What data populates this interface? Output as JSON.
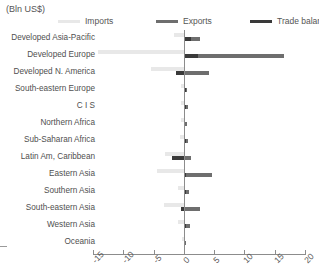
{
  "unit_label": "(Bln US$)",
  "legend": {
    "items": [
      {
        "label": "Imports",
        "color": "#e8e8e8",
        "left_px": 0
      },
      {
        "label": "Exports",
        "color": "#6e6e6e",
        "left_px": 98
      },
      {
        "label": "Trade balance",
        "color": "#3a3a3a",
        "left_px": 192
      }
    ]
  },
  "colors": {
    "imports": "#e8e8e8",
    "exports": "#6e6e6e",
    "balance": "#3a3a3a",
    "axis": "#8c8c8c",
    "text": "#4f4f4f"
  },
  "axis": {
    "ticks": [
      -15,
      -10,
      -5,
      0,
      5,
      10,
      15,
      20
    ],
    "tick_labels": [
      "-15",
      "-10",
      "-5",
      "0",
      "5",
      "10",
      "15",
      "20"
    ],
    "min": -15,
    "max": 20
  },
  "chart_data": {
    "type": "bar",
    "orientation": "horizontal",
    "title": "",
    "subtitle": "",
    "xlabel": "(Bln US$)",
    "ylabel": "",
    "xlim": [
      -15,
      20
    ],
    "grid": false,
    "legend_position": "top",
    "categories": [
      "Developed Asia-Pacific",
      "Developed Europe",
      "Developed N. America",
      "South-eastern Europe",
      "C I S",
      "Northern Africa",
      "Sub-Saharan Africa",
      "Latin Am, Caribbean",
      "Eastern Asia",
      "Southern Asia",
      "South-eastern Asia",
      "Western Asia",
      "Oceania"
    ],
    "series": [
      {
        "name": "Imports",
        "color": "#e8e8e8",
        "values": [
          -1.7,
          -14.2,
          -5.4,
          -0.5,
          -0.5,
          -0.4,
          -0.6,
          -3.1,
          -4.4,
          -0.9,
          -3.2,
          -0.9,
          -0.3
        ]
      },
      {
        "name": "Exports",
        "color": "#6e6e6e",
        "values": [
          2.6,
          16.6,
          4.1,
          0.6,
          0.7,
          0.5,
          0.7,
          1.2,
          4.6,
          0.8,
          2.6,
          1.0,
          0.3
        ]
      },
      {
        "name": "Trade balance",
        "color": "#3a3a3a",
        "values": [
          1.1,
          2.4,
          -1.3,
          0.3,
          0.3,
          0.2,
          0.3,
          -1.9,
          0.3,
          0.3,
          -0.5,
          0.4,
          0.1
        ]
      }
    ]
  }
}
